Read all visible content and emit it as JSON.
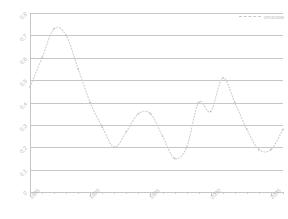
{
  "chart_data": {
    "type": "line",
    "title": "",
    "xlabel": "",
    "ylabel": "",
    "xlim": [
      1985,
      2006
    ],
    "ylim": [
      0,
      0.8
    ],
    "grid": true,
    "legend_position": "top-right",
    "line_style": "dotted",
    "line_color": "#cccccc",
    "x_tick_labels": [
      "1985",
      "1990",
      "1995",
      "2000",
      "2005"
    ],
    "x_tick_values": [
      1985,
      1990,
      1995,
      2000,
      2005
    ],
    "y_tick_labels": [
      "0",
      "0,1",
      "0,2",
      "0,3",
      "0,4",
      "0,5",
      "0,6",
      "0,7",
      "0,8"
    ],
    "y_tick_values": [
      0,
      0.1,
      0.2,
      0.3,
      0.4,
      0.5,
      0.6,
      0.7,
      0.8
    ],
    "series": [
      {
        "name": "vmsnow",
        "x": [
          1985,
          1986,
          1987,
          1988,
          1989,
          1990,
          1991,
          1992,
          1993,
          1994,
          1995,
          1996,
          1997,
          1998,
          1999,
          2000,
          2001,
          2002,
          2003,
          2004,
          2005,
          2006
        ],
        "values": [
          0.47,
          0.6,
          0.73,
          0.7,
          0.55,
          0.4,
          0.29,
          0.2,
          0.27,
          0.35,
          0.35,
          0.25,
          0.15,
          0.2,
          0.4,
          0.36,
          0.51,
          0.4,
          0.28,
          0.19,
          0.19,
          0.28
        ]
      }
    ]
  },
  "legend": {
    "label": "vmsnow"
  }
}
